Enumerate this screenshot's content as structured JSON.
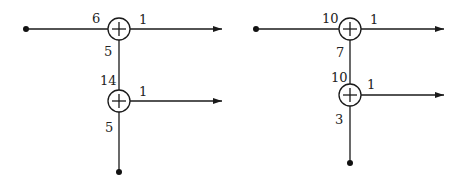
{
  "diagrams": [
    {
      "name": "left-network",
      "top_node": {
        "in_left": "6",
        "out_right": "1",
        "out_down": "5"
      },
      "bottom_node": {
        "in_up": "14",
        "out_right": "1",
        "out_down": "5"
      }
    },
    {
      "name": "right-network",
      "top_node": {
        "in_left": "10",
        "out_right": "1",
        "out_down": "7"
      },
      "bottom_node": {
        "in_up": "10",
        "out_right": "1",
        "out_down": "3"
      }
    }
  ],
  "node_symbol": "+",
  "colors": {
    "line": "#1a1a1a",
    "background": "#ffffff"
  }
}
